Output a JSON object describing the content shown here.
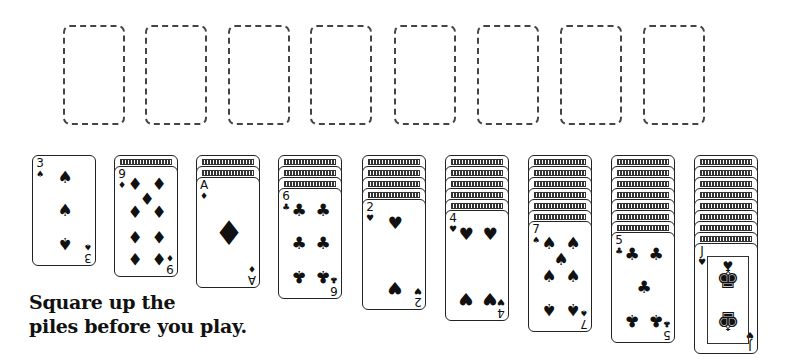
{
  "scene": "Solitaire (Klondike) initial layout illustration",
  "foundations": [
    {
      "x": 63,
      "state": "empty"
    },
    {
      "x": 145,
      "state": "empty"
    },
    {
      "x": 228,
      "state": "empty"
    },
    {
      "x": 310,
      "state": "empty"
    },
    {
      "x": 394,
      "state": "empty"
    },
    {
      "x": 477,
      "state": "empty"
    },
    {
      "x": 560,
      "state": "empty"
    },
    {
      "x": 643,
      "state": "empty"
    }
  ],
  "tableau": [
    {
      "x": 32,
      "facedown": 0,
      "top": {
        "rank": "3",
        "suit": "spades",
        "symbol": "♠"
      }
    },
    {
      "x": 114,
      "facedown": 1,
      "top": {
        "rank": "9",
        "suit": "diamonds",
        "symbol": "♦"
      }
    },
    {
      "x": 196,
      "facedown": 2,
      "top": {
        "rank": "A",
        "suit": "diamonds",
        "symbol": "♦"
      }
    },
    {
      "x": 278,
      "facedown": 3,
      "top": {
        "rank": "6",
        "suit": "clubs",
        "symbol": "♣"
      }
    },
    {
      "x": 362,
      "facedown": 4,
      "top": {
        "rank": "2",
        "suit": "hearts",
        "symbol": "♥"
      }
    },
    {
      "x": 445,
      "facedown": 5,
      "top": {
        "rank": "4",
        "suit": "hearts",
        "symbol": "♥"
      }
    },
    {
      "x": 528,
      "facedown": 6,
      "top": {
        "rank": "7",
        "suit": "spades",
        "symbol": "♠"
      }
    },
    {
      "x": 611,
      "facedown": 7,
      "top": {
        "rank": "5",
        "suit": "clubs",
        "symbol": "♣"
      }
    },
    {
      "x": 694,
      "facedown": 8,
      "top": {
        "rank": "J",
        "suit": "hearts",
        "symbol": "♥"
      }
    }
  ],
  "caption": {
    "line1": "Square up the",
    "line2": "piles before you play."
  },
  "colors": {
    "ink": "#111111",
    "background": "#ffffff"
  }
}
